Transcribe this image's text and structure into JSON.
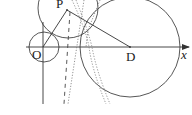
{
  "diagram": {
    "type": "geometry-coordinate-figure",
    "labels": {
      "origin": "O",
      "point_p": "P",
      "point_d": "D",
      "x_axis": "x"
    },
    "colors": {
      "stroke": "#333333",
      "dotted": "#777777",
      "background": "#ffffff"
    },
    "elements": [
      {
        "kind": "axis",
        "name": "x-axis",
        "from": [
          26,
          47
        ],
        "to": [
          189,
          47
        ],
        "arrow": true
      },
      {
        "kind": "axis",
        "name": "y-axis",
        "from": [
          43,
          22
        ],
        "to": [
          43,
          104
        ],
        "arrow": false
      },
      {
        "kind": "circle",
        "name": "circle-o",
        "center": [
          44,
          47
        ],
        "r": 15
      },
      {
        "kind": "circle",
        "name": "circle-p",
        "center": [
          68,
          8
        ],
        "r": 30
      },
      {
        "kind": "circle",
        "name": "circle-d",
        "center": [
          130,
          47
        ],
        "r": 50
      },
      {
        "kind": "segment",
        "name": "segment-op",
        "from": [
          43,
          47
        ],
        "to": [
          67,
          10
        ]
      },
      {
        "kind": "segment",
        "name": "segment-pd",
        "from": [
          67,
          10
        ],
        "to": [
          130,
          47
        ]
      },
      {
        "kind": "dashed-line",
        "name": "dashed-line-1",
        "from": [
          70,
          10
        ],
        "to": [
          64,
          104
        ]
      },
      {
        "kind": "dotted-line",
        "name": "dotted-line-1",
        "from": [
          82,
          0
        ],
        "to": [
          68,
          104
        ]
      },
      {
        "kind": "dotted-curve",
        "name": "dotted-curve-1"
      },
      {
        "kind": "dotted-curve",
        "name": "dotted-curve-2"
      }
    ]
  }
}
